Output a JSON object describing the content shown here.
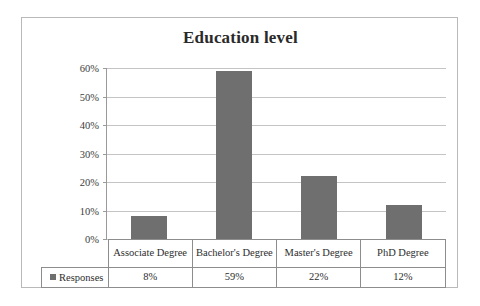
{
  "chart_data": {
    "type": "bar",
    "title": "Education level",
    "xlabel": "",
    "ylabel": "",
    "categories": [
      "Associate Degree",
      "Bachelor's Degree",
      "Master's Degree",
      "PhD Degree"
    ],
    "series": [
      {
        "name": "Responses",
        "values": [
          8,
          59,
          22,
          12
        ],
        "value_labels": [
          "8%",
          "59%",
          "22%",
          "12%"
        ],
        "color": "#6f6f6f"
      }
    ],
    "ylim": [
      0,
      60
    ],
    "ytick_values": [
      0,
      10,
      20,
      30,
      40,
      50,
      60
    ],
    "ytick_labels": [
      "0%",
      "10%",
      "20%",
      "30%",
      "40%",
      "50%",
      "60%"
    ],
    "grid": true,
    "legend_position": "data-table",
    "data_table_visible": true
  },
  "chart": {
    "title": "Education level",
    "legend_label": "Responses",
    "colors": {
      "bar": "#6f6f6f",
      "gridline": "#c4c4c4",
      "axis": "#9a9a9a",
      "frame": "#b9b9b9",
      "table_border": "#8d8d8d",
      "text": "#2d2d2d",
      "background": "#ffffff"
    }
  }
}
